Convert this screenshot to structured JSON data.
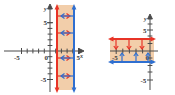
{
  "figure": {
    "title": "",
    "panels": [
      {
        "id": "left",
        "name": "vertical-inequality-graph",
        "axes": {
          "x_label": "x",
          "y_label": "y",
          "x_ticks": [
            -5,
            0,
            5
          ],
          "y_ticks": [
            5,
            -5
          ],
          "x_tick_labels": [
            "-5",
            "0",
            "5"
          ],
          "y_tick_labels": [
            "5",
            "-5"
          ],
          "origin_label": "0",
          "xlim": [
            -6,
            6
          ],
          "ylim": [
            -6,
            6
          ],
          "grid": false
        },
        "boundaries": [
          {
            "name": "red-vertical-boundary",
            "orientation": "vertical",
            "value": 1,
            "color": "#e83427",
            "style": "solid",
            "arrow_direction": "right"
          },
          {
            "name": "blue-vertical-boundary",
            "orientation": "vertical",
            "value": 4,
            "color": "#2f6fd0",
            "style": "solid",
            "arrow_direction": "left"
          }
        ],
        "shaded_region": {
          "name": "solution-band",
          "from": 1,
          "to": 4,
          "color": "#f2ceaa"
        }
      },
      {
        "id": "right",
        "name": "horizontal-inequality-graph",
        "axes": {
          "x_label": "",
          "y_label": "y",
          "x_ticks": [
            -5,
            0
          ],
          "y_ticks": [
            5,
            -5
          ],
          "x_tick_labels": [
            "-5",
            "0"
          ],
          "y_tick_labels": [
            "5",
            "-5"
          ],
          "origin_label": "0",
          "xlim": [
            -7,
            3
          ],
          "ylim": [
            -6,
            6
          ],
          "grid": false
        },
        "boundaries": [
          {
            "name": "red-horizontal-boundary",
            "orientation": "horizontal",
            "value": 2,
            "color": "#e83427",
            "style": "solid",
            "arrow_direction": "down"
          },
          {
            "name": "blue-horizontal-boundary",
            "orientation": "horizontal",
            "value": -1,
            "color": "#2f6fd0",
            "style": "solid",
            "arrow_direction": "up"
          }
        ],
        "shaded_region": {
          "name": "solution-band",
          "from": -1,
          "to": 2,
          "color": "#f2ceaa"
        }
      }
    ],
    "colors": {
      "red": "#e83427",
      "blue": "#2f6fd0",
      "shade": "#f2ceaa",
      "axis": "#4b4b4b",
      "background": "#ffffff"
    }
  }
}
